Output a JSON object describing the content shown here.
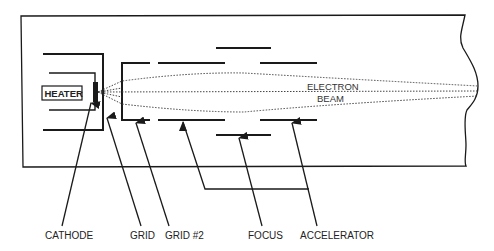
{
  "diagram": {
    "components": {
      "heater": "HEATER",
      "beam_line1": "ELECTRON",
      "beam_line2": "BEAM"
    },
    "callouts": [
      {
        "id": "cathode",
        "label": "CATHODE"
      },
      {
        "id": "grid",
        "label": "GRID"
      },
      {
        "id": "grid2",
        "label": "GRID #2"
      },
      {
        "id": "focus",
        "label": "FOCUS"
      },
      {
        "id": "accelerator",
        "label": "ACCELERATOR"
      }
    ],
    "colors": {
      "line": "#1a1a1a",
      "background": "#ffffff"
    }
  }
}
